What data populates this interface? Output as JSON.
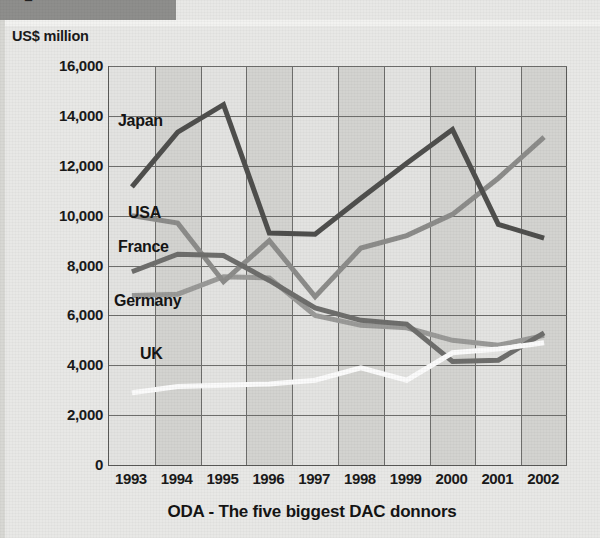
{
  "header": {
    "bar_glyph": "■",
    "bar_color": "#8e8e8c"
  },
  "axis_unit_label": "US$ million",
  "caption": "ODA - The five biggest DAC donnors",
  "chart_data": {
    "type": "line",
    "title": "ODA - The five biggest DAC donnors",
    "subtitle": "",
    "xlabel": "",
    "ylabel": "US$ million",
    "ylim": [
      0,
      16000
    ],
    "xlim": [
      "1993",
      "2002"
    ],
    "grid": true,
    "legend_position": "inline-labels",
    "y_ticks": [
      "0",
      "2,000",
      "4,000",
      "6,000",
      "8,000",
      "10,000",
      "12,000",
      "14,000",
      "16,000"
    ],
    "y_tick_values": [
      0,
      2000,
      4000,
      6000,
      8000,
      10000,
      12000,
      14000,
      16000
    ],
    "categories": [
      "1993",
      "1994",
      "1995",
      "1996",
      "1997",
      "1998",
      "1999",
      "2000",
      "2001",
      "2002"
    ],
    "series": [
      {
        "name": "Japan",
        "color": "#4f4f4d",
        "label_x": 118,
        "label_y": 112,
        "values": [
          11150,
          13350,
          14450,
          9300,
          9250,
          10700,
          12100,
          13450,
          9650,
          9100
        ]
      },
      {
        "name": "USA",
        "color": "#8c8c8a",
        "label_x": 128,
        "label_y": 204,
        "values": [
          10000,
          9700,
          7350,
          9000,
          6750,
          8700,
          9200,
          10050,
          11500,
          13150
        ]
      },
      {
        "name": "France",
        "color": "#6e6e6c",
        "label_x": 118,
        "label_y": 238,
        "values": [
          7750,
          8450,
          8400,
          7400,
          6300,
          5800,
          5650,
          4150,
          4200,
          5300
        ]
      },
      {
        "name": "Germany",
        "color": "#9a9a98",
        "label_x": 114,
        "label_y": 292,
        "values": [
          6800,
          6850,
          7550,
          7500,
          6000,
          5600,
          5500,
          5000,
          4800,
          5200
        ]
      },
      {
        "name": "UK",
        "color": "#fbfbfb",
        "label_x": 140,
        "label_y": 345,
        "values": [
          2900,
          3150,
          3200,
          3250,
          3400,
          3900,
          3400,
          4500,
          4650,
          4900
        ]
      }
    ]
  }
}
